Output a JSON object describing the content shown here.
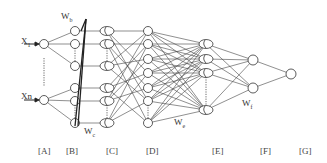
{
  "diagram": {
    "type": "neural-network",
    "colors": {
      "stroke": "#333333",
      "background": "#ffffff"
    },
    "inputs": [
      {
        "label": "X",
        "sub": "1"
      },
      {
        "label": "Xn",
        "sub": ""
      }
    ],
    "weights": {
      "wb": {
        "label": "W",
        "sub": "b"
      },
      "wc": {
        "label": "W",
        "sub": "c"
      },
      "we": {
        "label": "W",
        "sub": "e"
      },
      "wf": {
        "label": "W",
        "sub": "f"
      }
    },
    "layers": [
      {
        "id": "A",
        "label": "[A]"
      },
      {
        "id": "B",
        "label": "[B]"
      },
      {
        "id": "C",
        "label": "[C]"
      },
      {
        "id": "D",
        "label": "[D]"
      },
      {
        "id": "E",
        "label": "[E]"
      },
      {
        "id": "F",
        "label": "[F]"
      },
      {
        "id": "G",
        "label": "[G]"
      }
    ]
  }
}
